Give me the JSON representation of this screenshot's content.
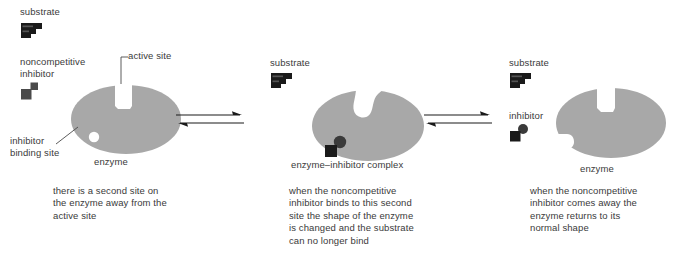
{
  "diagram": {
    "title_concept": "noncompetitive inhibition",
    "colors": {
      "enzyme_fill": "#a8a8a8",
      "molecule_fill": "#1a1a1a",
      "inhibitor_fill": "#4a4a4a",
      "binding_site_fill": "#ffffff",
      "text": "#3a3a3a",
      "arrow": "#1a1a1a",
      "background": "#ffffff"
    },
    "stages": [
      {
        "id": "stage-1",
        "labels": {
          "substrate": "substrate",
          "inhibitor": "noncompetitive\ninhibitor",
          "active_site": "active site",
          "binding_site": "inhibitor\nbinding site",
          "enzyme": "enzyme"
        },
        "caption": "there is a second site on\nthe enzyme away from the\nactive site",
        "icons": [
          "substrate-icon",
          "noncompetitive-inhibitor-icon"
        ],
        "enzyme_state": "normal-shape-open-active-site"
      },
      {
        "id": "stage-2",
        "labels": {
          "substrate": "substrate",
          "enzyme": "enzyme–inhibitor complex"
        },
        "caption": "when the noncompetitive\ninhibitor binds to this second\nsite the shape of the enzyme\nis changed and the substrate\ncan no longer bind",
        "icons": [
          "substrate-icon"
        ],
        "enzyme_state": "distorted-active-site-inhibitor-bound"
      },
      {
        "id": "stage-3",
        "labels": {
          "substrate": "substrate",
          "inhibitor": "inhibitor",
          "enzyme": "enzyme"
        },
        "caption": "when the noncompetitive\ninhibitor comes away the\nenzyme returns to its\nnormal shape",
        "icons": [
          "substrate-icon",
          "inhibitor-icon"
        ],
        "enzyme_state": "normal-shape-restored"
      }
    ],
    "arrows": [
      {
        "id": "arrow-1",
        "type": "reversible-double-arrow"
      },
      {
        "id": "arrow-2",
        "type": "reversible-double-arrow"
      }
    ]
  }
}
